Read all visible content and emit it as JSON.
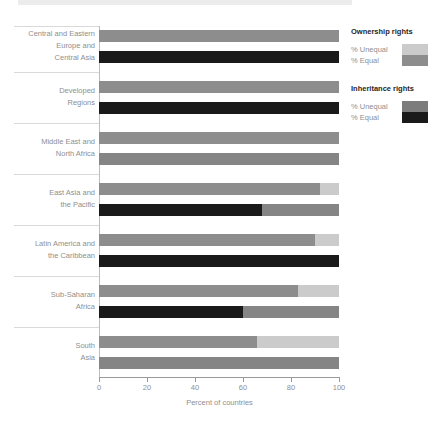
{
  "chart_data": {
    "type": "bar",
    "orientation": "horizontal",
    "stacked": true,
    "title": "",
    "xlabel": "Percent of countries",
    "xlim": [
      0,
      100
    ],
    "x_ticks": [
      0,
      20,
      40,
      60,
      80,
      100
    ],
    "grid": false,
    "legend_position": "right",
    "series_meaning": "Each region has two 100%-stacked bars: Ownership rights (gray = % Equal, light gray = % Unequal) and Inheritance rights (black = % Equal, gray = % Unequal)",
    "groups": [
      {
        "label_lines": [
          "Central and Eastern",
          "Europe and",
          "Central Asia"
        ],
        "ownership": {
          "equal": 100,
          "unequal": 0
        },
        "inheritance": {
          "equal": 100,
          "unequal": 0
        }
      },
      {
        "label_lines": [
          "Developed",
          "Regions"
        ],
        "ownership": {
          "equal": 100,
          "unequal": 0
        },
        "inheritance": {
          "equal": 100,
          "unequal": 0
        }
      },
      {
        "label_lines": [
          "Middle East and",
          "North Africa"
        ],
        "ownership": {
          "equal": 100,
          "unequal": 0
        },
        "inheritance": {
          "equal": 0,
          "unequal": 100
        }
      },
      {
        "label_lines": [
          "East Asia and",
          "the Pacific"
        ],
        "ownership": {
          "equal": 92,
          "unequal": 8
        },
        "inheritance": {
          "equal": 68,
          "unequal": 32
        }
      },
      {
        "label_lines": [
          "Latin America and",
          "the Caribbean"
        ],
        "ownership": {
          "equal": 90,
          "unequal": 10
        },
        "inheritance": {
          "equal": 100,
          "unequal": 0
        }
      },
      {
        "label_lines": [
          "Sub-Saharan",
          "Africa"
        ],
        "ownership": {
          "equal": 83,
          "unequal": 17
        },
        "inheritance": {
          "equal": 60,
          "unequal": 40
        }
      },
      {
        "label_lines": [
          "South",
          "Asia"
        ],
        "ownership": {
          "equal": 66,
          "unequal": 34
        },
        "inheritance": {
          "equal": 0,
          "unequal": 100
        }
      }
    ]
  },
  "legend": {
    "ownership": {
      "title": "Ownership rights",
      "unequal_label": "% Unequal",
      "equal_label": "% Equal"
    },
    "inheritance": {
      "title": "Inheritance rights",
      "unequal_label": "% Unequal",
      "equal_label": "% Equal"
    }
  },
  "colors": {
    "ownership_equal": "#8d8d8d",
    "ownership_unequal": "#cbcbcb",
    "inheritance_equal": "#1a1a1a",
    "inheritance_unequal": "#858585",
    "legend_inheritance_unequal": "#7c7c7c",
    "top_strip": "#ececec",
    "axis": "#9a9a9a",
    "separator": "#d9d9d9",
    "text_gray": "#8f8f8f",
    "text_dark": "#262626"
  }
}
